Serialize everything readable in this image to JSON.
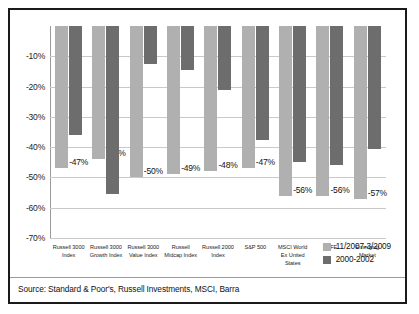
{
  "source_note": "Source: Standard & Poor's, Russell Investments, MSCI, Barra",
  "legend": {
    "position": "bottom-right",
    "entries": [
      {
        "label": "11/2007-3/2009",
        "color": "#b0b0b0"
      },
      {
        "label": "2000-2002",
        "color": "#6d6d6d"
      }
    ]
  },
  "chart_data": {
    "type": "bar",
    "title": "",
    "xlabel": "",
    "ylabel": "",
    "ylim": [
      -70,
      0
    ],
    "grid": true,
    "ytick_labels": [
      "-10%",
      "-20%",
      "-30%",
      "-40%",
      "-50%",
      "-60%",
      "-70%"
    ],
    "ytick_values": [
      -10,
      -20,
      -30,
      -40,
      -50,
      -60,
      -70
    ],
    "categories": [
      "Russell 3000 Index",
      "Russell 3000 Growth Index",
      "Russell 3000 Value Index",
      "Russell Midcap Index",
      "Russell 2000 Index",
      "S&P 500",
      "MSCI World Ex United States",
      "EAFE",
      "Emerging Market"
    ],
    "category_lines": [
      [
        "Russell 3000",
        "Index"
      ],
      [
        "Russell 3000",
        "Growth Index"
      ],
      [
        "Russell 3000",
        "Value Index"
      ],
      [
        "Russell",
        "Midcap Index"
      ],
      [
        "Russell 2000",
        "Index"
      ],
      [
        "S&P 500"
      ],
      [
        "MSCI World",
        "Ex United States"
      ],
      [
        "EAFE"
      ],
      [
        "Emerging",
        "Market"
      ]
    ],
    "series": [
      {
        "name": "11/2007-3/2009",
        "color": "#b0b0b0",
        "values": [
          -47,
          -44,
          -50,
          -49,
          -48,
          -47,
          -56,
          -56,
          -57
        ],
        "data_labels": [
          "-47%",
          "-44%",
          "-50%",
          "-49%",
          "-48%",
          "-47%",
          "-56%",
          "-56%",
          "-57%"
        ]
      },
      {
        "name": "2000-2002",
        "color": "#6d6d6d",
        "values": [
          -36,
          -55.5,
          -12.5,
          -14.5,
          -21,
          -37.5,
          -45,
          -46,
          -40.5
        ],
        "data_labels": [
          "",
          "",
          "",
          "",
          "",
          "",
          "",
          "",
          ""
        ]
      }
    ]
  }
}
